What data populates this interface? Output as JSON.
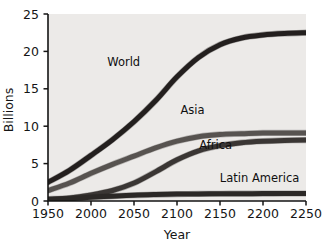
{
  "chart_data": {
    "type": "line",
    "title": "",
    "xlabel": "Year",
    "ylabel": "Billions",
    "xlim": [
      1950,
      2250
    ],
    "ylim": [
      0,
      25
    ],
    "xticks": [
      1950,
      2000,
      2050,
      2100,
      2150,
      2200,
      2250
    ],
    "yticks": [
      0,
      5,
      10,
      15,
      20,
      25
    ],
    "grid": false,
    "legend_position": "inline-annotations",
    "plot_background": "#eceae8",
    "x": [
      1950,
      1975,
      2000,
      2025,
      2050,
      2075,
      2100,
      2125,
      2150,
      2175,
      2200,
      2225,
      2250
    ],
    "series": [
      {
        "name": "World",
        "label": "World",
        "color": "#231f1e",
        "values": [
          2.5,
          4.1,
          6.1,
          8.2,
          10.6,
          13.4,
          16.6,
          19.2,
          20.9,
          21.8,
          22.2,
          22.4,
          22.5
        ]
      },
      {
        "name": "Asia",
        "label": "Asia",
        "color": "#575350",
        "values": [
          1.4,
          2.4,
          3.7,
          4.9,
          6.0,
          7.1,
          8.0,
          8.6,
          8.9,
          9.0,
          9.1,
          9.1,
          9.1
        ]
      },
      {
        "name": "Africa",
        "label": "Africa",
        "color": "#3a3634",
        "values": [
          0.25,
          0.4,
          0.8,
          1.4,
          2.4,
          3.9,
          5.5,
          6.7,
          7.4,
          7.8,
          8.0,
          8.1,
          8.15
        ]
      },
      {
        "name": "Latin America",
        "label": "Latin America",
        "color": "#2b2826",
        "values": [
          0.18,
          0.3,
          0.5,
          0.65,
          0.78,
          0.86,
          0.92,
          0.95,
          0.97,
          0.98,
          0.99,
          1.0,
          1.0
        ]
      }
    ],
    "annotations": [
      {
        "text": "World",
        "x": 2038,
        "y": 18.0
      },
      {
        "text": "Asia",
        "x": 2118,
        "y": 11.6
      },
      {
        "text": "Africa",
        "x": 2145,
        "y": 6.9
      },
      {
        "text": "Latin America",
        "x": 2196,
        "y": 2.6
      }
    ]
  }
}
